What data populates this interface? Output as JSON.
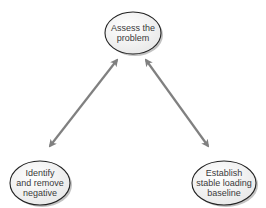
{
  "diagram": {
    "type": "cycle",
    "colors": {
      "node_fill": "#f4f4f4",
      "node_stroke": "#222222",
      "shadow": "#9a9a9a",
      "arrow": "#808080",
      "text": "#3a3a3a"
    },
    "nodes": [
      {
        "id": "assess",
        "label": "Assess the\nproblem"
      },
      {
        "id": "identify",
        "label": "Identify\nand remove\nnegative"
      },
      {
        "id": "establish",
        "label": "Establish\nstable loading\nbaseline"
      }
    ],
    "edges": [
      {
        "from": "assess",
        "to": "identify",
        "direction": "bidirectional"
      },
      {
        "from": "assess",
        "to": "establish",
        "direction": "bidirectional"
      }
    ]
  }
}
